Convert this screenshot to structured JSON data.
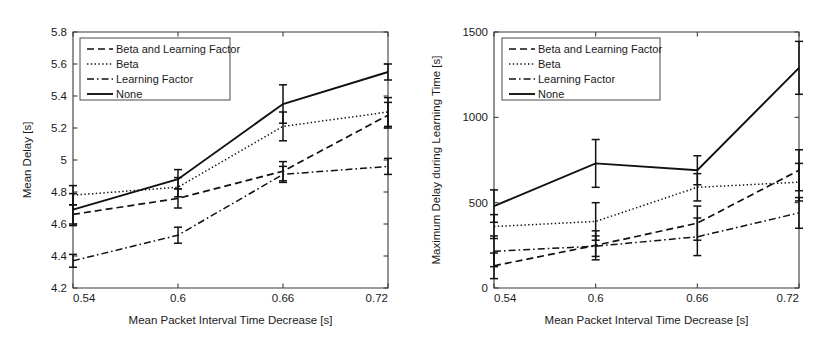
{
  "figure": {
    "panel_count": 2,
    "background_color": "#ffffff",
    "line_color": "#111111"
  },
  "chart_data": [
    {
      "id": "left-panel",
      "type": "line",
      "title": "",
      "xlabel": "Mean Packet Interval Time Decrease [s]",
      "ylabel": "Mean Delay [s]",
      "x": [
        0.54,
        0.6,
        0.66,
        0.72
      ],
      "xtick_labels": [
        "0.54",
        "0.6",
        "0.66",
        "0.72"
      ],
      "ytick_labels": [
        "4.2",
        "4.4",
        "4.6",
        "4.8",
        "5",
        "5.2",
        "5.4",
        "5.6",
        "5.8"
      ],
      "yticks": [
        4.2,
        4.4,
        4.6,
        4.8,
        5.0,
        5.2,
        5.4,
        5.6,
        5.8
      ],
      "xlim": [
        0.54,
        0.72
      ],
      "ylim": [
        4.2,
        5.8
      ],
      "grid": false,
      "legend_position": "upper left",
      "series": [
        {
          "name": "Beta and Learning Factor",
          "style": "dashed",
          "values": [
            4.66,
            4.76,
            4.93,
            5.28
          ],
          "errors": [
            0.06,
            0.06,
            0.06,
            0.08
          ]
        },
        {
          "name": "Beta",
          "style": "dotted",
          "values": [
            4.78,
            4.83,
            5.21,
            5.3
          ],
          "errors": [
            0.06,
            0.06,
            0.09,
            0.09
          ]
        },
        {
          "name": "Learning Factor",
          "style": "dashdot",
          "values": [
            4.37,
            4.53,
            4.91,
            4.96
          ],
          "errors": [
            0.04,
            0.05,
            0.05,
            0.05
          ]
        },
        {
          "name": "None",
          "style": "solid",
          "values": [
            4.69,
            4.88,
            5.35,
            5.55
          ],
          "errors": [
            0.1,
            0.06,
            0.12,
            0.05
          ]
        }
      ]
    },
    {
      "id": "right-panel",
      "type": "line",
      "title": "",
      "xlabel": "Mean Packet Interval Time Decrease [s]",
      "ylabel": "Maximum Delay during Learning Time [s]",
      "x": [
        0.54,
        0.6,
        0.66,
        0.72
      ],
      "xtick_labels": [
        "0.54",
        "0.6",
        "0.66",
        "0.72"
      ],
      "ytick_labels": [
        "0",
        "500",
        "1000",
        "1500"
      ],
      "yticks": [
        0,
        500,
        1000,
        1500
      ],
      "xlim": [
        0.54,
        0.72
      ],
      "ylim": [
        0,
        1500
      ],
      "grid": false,
      "legend_position": "upper left",
      "series": [
        {
          "name": "Beta and Learning Factor",
          "style": "dashed",
          "values": [
            130,
            250,
            380,
            690
          ],
          "errors": [
            75,
            85,
            100,
            120
          ]
        },
        {
          "name": "Beta",
          "style": "dotted",
          "values": [
            360,
            390,
            590,
            620
          ],
          "errors": [
            70,
            110,
            80,
            110
          ]
        },
        {
          "name": "Learning Factor",
          "style": "dashdot",
          "values": [
            215,
            245,
            300,
            440
          ],
          "errors": [
            90,
            60,
            110,
            90
          ]
        },
        {
          "name": "None",
          "style": "solid",
          "values": [
            480,
            730,
            690,
            1290
          ],
          "errors": [
            95,
            140,
            85,
            155
          ]
        }
      ]
    }
  ]
}
